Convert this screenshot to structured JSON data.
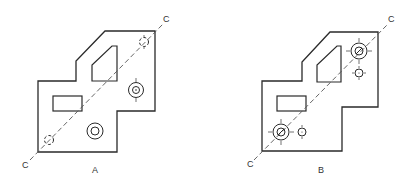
{
  "figures": [
    {
      "id": "A",
      "caption": "A",
      "axis_label_top": "C",
      "axis_label_bottom": "C",
      "outline_points": "38,81 76,81 76,61 105,31 155,31 155,111 117,111 117,152 38,152",
      "cutout_trapezoid": "112,46 117,46 117,81 92,81 92,65",
      "cutout_rect": {
        "x": 53,
        "y": 96,
        "w": 29,
        "h": 15
      },
      "centerline": {
        "x1": 30,
        "y1": 160,
        "x2": 163,
        "y2": 24
      },
      "holes": [
        {
          "name": "small-hole-top-right",
          "cx": 144,
          "cy": 42,
          "r": 4,
          "style": "dashed-ticks"
        },
        {
          "name": "counterbore-hole-right",
          "cx": 136,
          "cy": 90,
          "r_outer": 7,
          "r_inner": 3,
          "style": "ring-ticks"
        },
        {
          "name": "counterbore-hole-bottom",
          "cx": 95,
          "cy": 131,
          "r_outer": 8,
          "r_inner": 4,
          "style": "ring"
        },
        {
          "name": "small-hole-bottom-left",
          "cx": 49,
          "cy": 140,
          "r": 4,
          "style": "dashed"
        }
      ]
    },
    {
      "id": "B",
      "caption": "B",
      "axis_label_top": "C",
      "axis_label_bottom": "C",
      "outline_points": "262,81 302,81 302,62 330,32 378,32 378,107 342,107 342,151 262,151",
      "cutout_trapezoid": "337,46 341,46 341,82 317,82 317,65",
      "cutout_rect": {
        "x": 277,
        "y": 96,
        "w": 29,
        "h": 15
      },
      "centerline": {
        "x1": 254,
        "y1": 160,
        "x2": 388,
        "y2": 24
      },
      "holes": [
        {
          "name": "counterbore-hole-top-right",
          "cx": 359,
          "cy": 51,
          "r_outer": 8,
          "r_inner": 4,
          "style": "ring-slash-ticks"
        },
        {
          "name": "small-hole-right",
          "cx": 359,
          "cy": 73,
          "r": 4,
          "style": "ticks"
        },
        {
          "name": "counterbore-hole-bottom-left",
          "cx": 281,
          "cy": 132,
          "r_outer": 8,
          "r_inner": 4,
          "style": "ring-slash-ticks"
        },
        {
          "name": "small-hole-bottom",
          "cx": 302,
          "cy": 132,
          "r": 4,
          "style": "ticks"
        }
      ]
    }
  ],
  "colors": {
    "line": "#2a2a2a",
    "centerline": "#555555",
    "background": "#ffffff"
  }
}
